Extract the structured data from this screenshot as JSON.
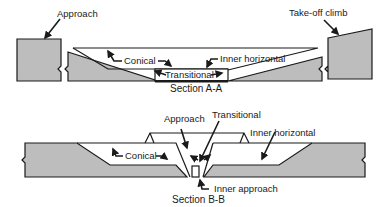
{
  "diagram": {
    "section_aa": {
      "caption": "Section A-A",
      "labels": {
        "approach": "Approach",
        "takeoff": "Take-off climb",
        "conical": "Conical",
        "inner_horizontal": "Inner horizontal",
        "transitional": "Transitional"
      }
    },
    "section_bb": {
      "caption": "Section B-B",
      "labels": {
        "approach": "Approach",
        "transitional": "Transitional",
        "inner_horizontal": "Inner horizontal",
        "conical": "Conical",
        "inner_approach": "Inner approach"
      }
    },
    "colors": {
      "fill": "#bdbdbd",
      "stroke": "#1a1a1a"
    }
  }
}
